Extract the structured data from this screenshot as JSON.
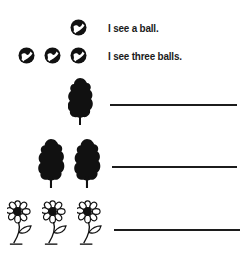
{
  "worksheet": {
    "examples": [
      {
        "count": 1,
        "object": "ball",
        "sentence": "I see a ball."
      },
      {
        "count": 3,
        "object": "ball",
        "sentence": "I see three balls."
      }
    ],
    "exercises": [
      {
        "count": 1,
        "object": "tree",
        "answer": ""
      },
      {
        "count": 2,
        "object": "tree",
        "answer": ""
      },
      {
        "count": 3,
        "object": "flower",
        "answer": ""
      }
    ]
  },
  "colors": {
    "ink": "#1a1a1a",
    "paper": "#ffffff"
  },
  "icons": {
    "ball": "ball-icon",
    "tree": "tree-icon",
    "flower": "flower-icon"
  }
}
